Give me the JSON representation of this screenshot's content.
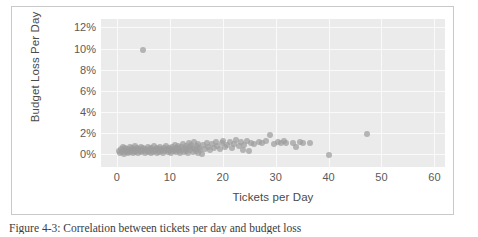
{
  "figure": {
    "caption": "Figure 4-3: Correlation between tickets per day and budget loss"
  },
  "chart_data": {
    "type": "scatter",
    "title": "",
    "xlabel": "Tickets per Day",
    "ylabel": "Budget Loss Per Day",
    "xlim": [
      -3,
      62
    ],
    "ylim": [
      -0.012,
      0.128
    ],
    "grid": true,
    "legend": false,
    "marker_color": "#9d9d9d",
    "plot_background": "#ebebeb",
    "gridline_color": "#fafafa",
    "xticks": [
      0,
      10,
      20,
      30,
      40,
      50,
      60
    ],
    "xtick_labels": [
      "0",
      "10",
      "20",
      "30",
      "40",
      "50",
      "60"
    ],
    "yticks": [
      0,
      0.02,
      0.04,
      0.06,
      0.08,
      0.1,
      0.12
    ],
    "ytick_labels": [
      "0%",
      "2%",
      "4%",
      "6%",
      "8%",
      "10%",
      "12%"
    ],
    "series": [
      {
        "name": "Tickets vs Budget Loss",
        "points": [
          [
            5.0,
            0.099
          ],
          [
            0.4,
            0.003
          ],
          [
            0.6,
            0.001
          ],
          [
            0.8,
            0.005
          ],
          [
            1.0,
            0.002
          ],
          [
            1.1,
            0.007
          ],
          [
            1.3,
            0.0
          ],
          [
            1.4,
            0.004
          ],
          [
            1.6,
            0.006
          ],
          [
            1.7,
            0.002
          ],
          [
            1.9,
            0.003
          ],
          [
            2.0,
            0.005
          ],
          [
            2.1,
            0.001
          ],
          [
            2.3,
            0.004
          ],
          [
            2.4,
            0.007
          ],
          [
            2.5,
            0.002
          ],
          [
            2.7,
            0.003
          ],
          [
            2.8,
            0.006
          ],
          [
            3.0,
            0.004
          ],
          [
            3.1,
            0.001
          ],
          [
            3.2,
            0.005
          ],
          [
            3.4,
            0.002
          ],
          [
            3.5,
            0.008
          ],
          [
            3.6,
            0.003
          ],
          [
            3.8,
            0.006
          ],
          [
            3.9,
            0.004
          ],
          [
            4.0,
            0.001
          ],
          [
            4.2,
            0.005
          ],
          [
            4.3,
            0.003
          ],
          [
            4.5,
            0.007
          ],
          [
            4.6,
            0.002
          ],
          [
            4.8,
            0.004
          ],
          [
            5.0,
            0.006
          ],
          [
            5.1,
            0.003
          ],
          [
            5.3,
            0.001
          ],
          [
            5.4,
            0.005
          ],
          [
            5.6,
            0.004
          ],
          [
            5.8,
            0.002
          ],
          [
            5.9,
            0.007
          ],
          [
            6.0,
            0.003
          ],
          [
            6.2,
            0.005
          ],
          [
            6.4,
            0.001
          ],
          [
            6.5,
            0.006
          ],
          [
            6.7,
            0.004
          ],
          [
            6.8,
            0.002
          ],
          [
            7.0,
            0.008
          ],
          [
            7.2,
            0.003
          ],
          [
            7.3,
            0.005
          ],
          [
            7.5,
            0.001
          ],
          [
            7.6,
            0.006
          ],
          [
            7.8,
            0.004
          ],
          [
            8.0,
            0.002
          ],
          [
            8.1,
            0.007
          ],
          [
            8.3,
            0.003
          ],
          [
            8.4,
            0.005
          ],
          [
            8.6,
            0.004
          ],
          [
            8.8,
            0.001
          ],
          [
            8.9,
            0.006
          ],
          [
            9.1,
            0.003
          ],
          [
            9.2,
            0.008
          ],
          [
            9.4,
            0.005
          ],
          [
            9.6,
            0.002
          ],
          [
            9.7,
            0.004
          ],
          [
            9.9,
            0.006
          ],
          [
            10.0,
            0.003
          ],
          [
            10.2,
            0.001
          ],
          [
            10.4,
            0.007
          ],
          [
            10.5,
            0.005
          ],
          [
            10.7,
            0.003
          ],
          [
            10.9,
            0.009
          ],
          [
            11.0,
            0.004
          ],
          [
            11.2,
            0.002
          ],
          [
            11.3,
            0.006
          ],
          [
            11.5,
            0.008
          ],
          [
            11.7,
            0.003
          ],
          [
            11.8,
            0.005
          ],
          [
            12.0,
            0.001
          ],
          [
            12.2,
            0.007
          ],
          [
            12.3,
            0.004
          ],
          [
            12.5,
            0.01
          ],
          [
            12.6,
            0.002
          ],
          [
            12.8,
            0.006
          ],
          [
            13.0,
            0.008
          ],
          [
            13.1,
            0.003
          ],
          [
            13.3,
            0.005
          ],
          [
            13.5,
            0.001
          ],
          [
            13.6,
            0.011
          ],
          [
            13.8,
            0.007
          ],
          [
            13.9,
            0.004
          ],
          [
            14.1,
            0.009
          ],
          [
            14.3,
            0.002
          ],
          [
            14.4,
            0.006
          ],
          [
            14.6,
            0.012
          ],
          [
            14.8,
            0.005
          ],
          [
            14.9,
            0.003
          ],
          [
            15.1,
            0.008
          ],
          [
            15.3,
            0.01
          ],
          [
            15.4,
            0.001
          ],
          [
            15.6,
            0.006
          ],
          [
            15.8,
            0.004
          ],
          [
            16.0,
            0.0
          ],
          [
            16.3,
            0.009
          ],
          [
            16.6,
            0.005
          ],
          [
            17.0,
            0.011
          ],
          [
            17.3,
            0.007
          ],
          [
            17.6,
            0.004
          ],
          [
            18.0,
            0.01
          ],
          [
            18.3,
            0.006
          ],
          [
            18.7,
            0.012
          ],
          [
            19.0,
            0.008
          ],
          [
            19.4,
            0.005
          ],
          [
            19.8,
            0.011
          ],
          [
            20.1,
            0.013
          ],
          [
            20.5,
            0.007
          ],
          [
            20.9,
            0.009
          ],
          [
            21.3,
            0.012
          ],
          [
            21.8,
            0.006
          ],
          [
            22.2,
            0.01
          ],
          [
            22.6,
            0.014
          ],
          [
            23.0,
            0.008
          ],
          [
            23.4,
            0.012
          ],
          [
            23.8,
            0.004
          ],
          [
            24.1,
            0.009
          ],
          [
            24.5,
            0.013
          ],
          [
            24.9,
            0.003
          ],
          [
            25.3,
            0.011
          ],
          [
            26.0,
            0.01
          ],
          [
            26.8,
            0.012
          ],
          [
            27.5,
            0.011
          ],
          [
            28.2,
            0.013
          ],
          [
            28.9,
            0.018
          ],
          [
            29.6,
            0.01
          ],
          [
            30.4,
            0.012
          ],
          [
            31.1,
            0.011
          ],
          [
            31.5,
            0.013
          ],
          [
            32.0,
            0.011
          ],
          [
            33.2,
            0.011
          ],
          [
            33.8,
            0.007
          ],
          [
            34.6,
            0.012
          ],
          [
            35.2,
            0.011
          ],
          [
            36.5,
            0.011
          ],
          [
            40.0,
            -0.001
          ],
          [
            47.3,
            0.019
          ]
        ]
      }
    ]
  }
}
